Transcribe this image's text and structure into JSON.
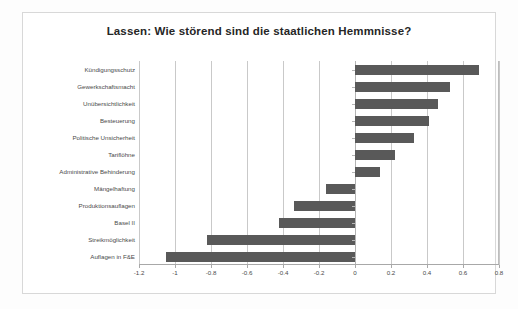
{
  "chart_data": {
    "type": "bar",
    "orientation": "horizontal",
    "title": "Lassen: Wie störend sind die staatlichen Hemmnisse?",
    "xlabel": "",
    "ylabel": "",
    "categories": [
      "Kündigungsschutz",
      "Gewerkschaftsmacht",
      "Unübersichtlichkeit",
      "Besteuerung",
      "Politische Unsicherheit",
      "Tariflöhne",
      "Administrative Behinderung",
      "Mängelhaftung",
      "Produktionsauflagen",
      "Basel II",
      "Streikmöglichkeit",
      "Auflagen in F&E"
    ],
    "values": [
      0.69,
      0.53,
      0.46,
      0.41,
      0.33,
      0.22,
      0.14,
      -0.16,
      -0.34,
      -0.42,
      -0.82,
      -1.05
    ],
    "xlim": [
      -1.2,
      0.8
    ],
    "xticks": [
      -1.2,
      -1,
      -0.8,
      -0.6,
      -0.4,
      -0.2,
      0,
      0.2,
      0.4,
      0.6,
      0.8
    ],
    "xtick_labels": [
      "-1.2",
      "-1",
      "-0.8",
      "-0.6",
      "-0.4",
      "-0.2",
      "0",
      "0.2",
      "0.4",
      "0.6",
      "0.8"
    ],
    "grid": true,
    "legend": false,
    "bar_color": "#595959",
    "grid_color": "#c9c9c9",
    "title_color": "#262626",
    "label_color": "#4a4a4a",
    "background_color": "#ffffff",
    "frame_color": "#d8d8d8"
  }
}
